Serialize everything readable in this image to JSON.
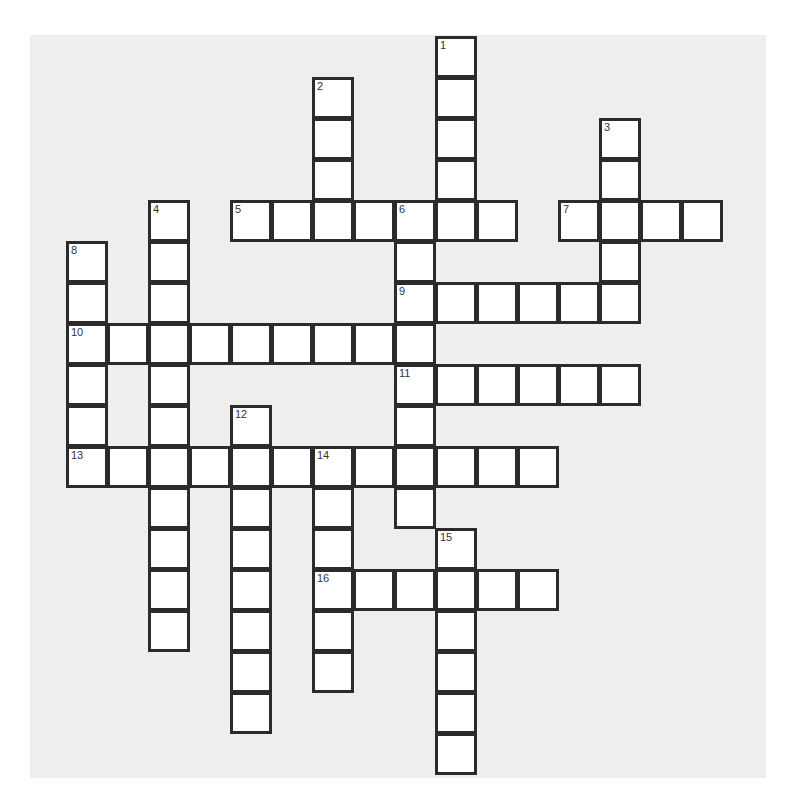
{
  "puzzle": {
    "type": "crossword",
    "background_color": "#eeeeee",
    "cell_color": "#ffffff",
    "border_color": "#2b2b2b",
    "grid_origin": {
      "x": 67,
      "y": 37
    },
    "cell_pitch": 41,
    "entries": [
      {
        "number": "1",
        "direction": "down",
        "row": 0,
        "col": 9,
        "length": 5
      },
      {
        "number": "2",
        "direction": "down",
        "row": 1,
        "col": 6,
        "length": 4
      },
      {
        "number": "3",
        "direction": "down",
        "row": 2,
        "col": 13,
        "length": 5
      },
      {
        "number": "4",
        "direction": "down",
        "row": 4,
        "col": 2,
        "length": 11
      },
      {
        "number": "5",
        "direction": "across",
        "row": 4,
        "col": 4,
        "length": 7
      },
      {
        "number": "6",
        "direction": "down",
        "row": 4,
        "col": 8,
        "length": 8
      },
      {
        "number": "7",
        "direction": "across",
        "row": 4,
        "col": 12,
        "length": 4
      },
      {
        "number": "8",
        "direction": "down",
        "row": 5,
        "col": 0,
        "length": 6
      },
      {
        "number": "9",
        "direction": "across",
        "row": 6,
        "col": 8,
        "length": 6
      },
      {
        "number": "10",
        "direction": "across",
        "row": 7,
        "col": 0,
        "length": 9
      },
      {
        "number": "11",
        "direction": "across",
        "row": 8,
        "col": 8,
        "length": 6
      },
      {
        "number": "12",
        "direction": "down",
        "row": 9,
        "col": 4,
        "length": 8
      },
      {
        "number": "13",
        "direction": "across",
        "row": 10,
        "col": 0,
        "length": 12
      },
      {
        "number": "14",
        "direction": "down",
        "row": 10,
        "col": 6,
        "length": 6
      },
      {
        "number": "15",
        "direction": "down",
        "row": 12,
        "col": 9,
        "length": 6
      },
      {
        "number": "16",
        "direction": "across",
        "row": 13,
        "col": 6,
        "length": 6
      }
    ]
  }
}
